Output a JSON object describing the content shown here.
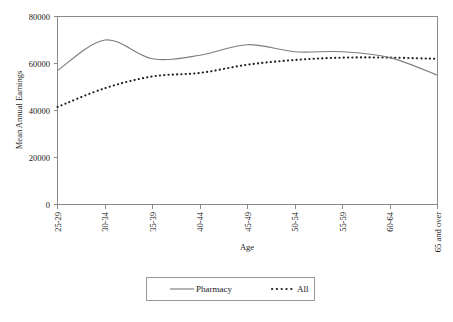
{
  "chart_data": {
    "type": "line",
    "title": "",
    "xlabel": "Age",
    "ylabel": "Mean Annual Earnings",
    "categories": [
      "25-29",
      "30-34",
      "35-39",
      "40-44",
      "45-49",
      "50-54",
      "55-59",
      "60-64",
      "65 and over"
    ],
    "series": [
      {
        "name": "Pharmacy",
        "style": "solid",
        "color": "#7d7d7d",
        "values": [
          57000,
          70000,
          62000,
          63500,
          68000,
          65000,
          65000,
          62500,
          55000
        ]
      },
      {
        "name": "All",
        "style": "dotted",
        "color": "#222222",
        "values": [
          41500,
          49500,
          54500,
          56000,
          59500,
          61500,
          62500,
          62500,
          62000
        ]
      }
    ],
    "ylim": [
      0,
      80000
    ],
    "yticks": [
      "0",
      "20000",
      "40000",
      "60000",
      "80000"
    ],
    "ytick_values": [
      0,
      20000,
      40000,
      60000,
      80000
    ],
    "grid": false,
    "legend_position": "bottom",
    "legend_entries": [
      "Pharmacy",
      "All"
    ]
  },
  "axes": {
    "y_label": "Mean Annual Earnings",
    "x_label": "Age"
  }
}
